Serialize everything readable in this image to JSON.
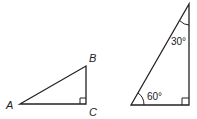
{
  "diagram": {
    "triangle_left": {
      "vertices": {
        "A": {
          "label": "A",
          "x": 20,
          "y": 104
        },
        "B": {
          "label": "B",
          "x": 86,
          "y": 66
        },
        "C": {
          "label": "C",
          "x": 86,
          "y": 104
        }
      },
      "right_angle_at": "C"
    },
    "triangle_right": {
      "vertices": {
        "top": {
          "x": 189,
          "y": 4
        },
        "bottom_left": {
          "x": 131,
          "y": 105
        },
        "bottom_right": {
          "x": 189,
          "y": 105
        }
      },
      "angles": {
        "top": "30°",
        "bottom_left": "60°"
      },
      "right_angle_at": "bottom_right"
    },
    "stroke_color": "#222222"
  }
}
